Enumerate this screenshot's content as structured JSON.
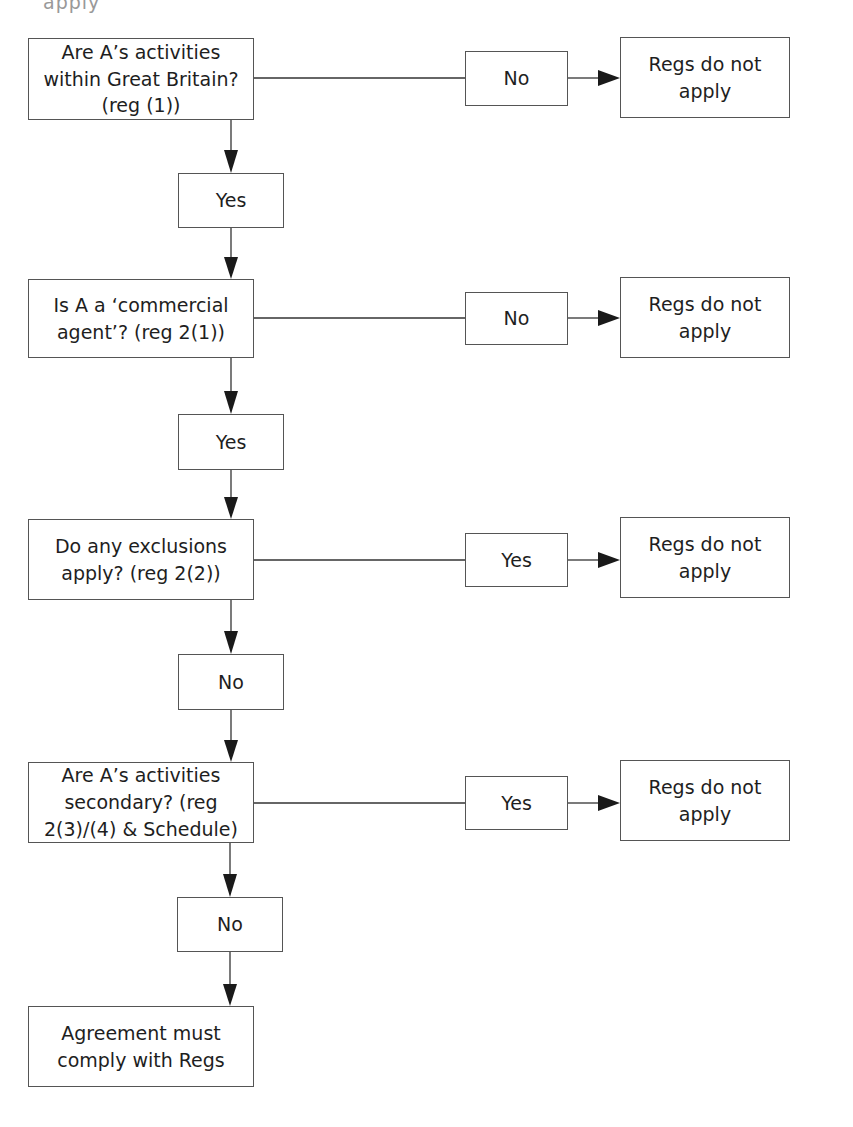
{
  "top_fragment": "apply",
  "rows": [
    {
      "question": "Are A’s activities within Great Britain? (reg (1))",
      "branch_label": "No",
      "outcome": "Regs do not apply",
      "continue_label": "Yes"
    },
    {
      "question": "Is A a ‘commercial agent’? (reg 2(1))",
      "branch_label": "No",
      "outcome": "Regs do not apply",
      "continue_label": "Yes"
    },
    {
      "question": "Do any exclusions apply? (reg 2(2))",
      "branch_label": "Yes",
      "outcome": "Regs do not apply",
      "continue_label": "No"
    },
    {
      "question": "Are A’s activities secondary? (reg 2(3)/(4) & Schedule)",
      "branch_label": "Yes",
      "outcome": "Regs do not apply",
      "continue_label": "No"
    }
  ],
  "final": "Agreement must comply with Regs",
  "colors": {
    "border": "#555555",
    "text": "#1e1e1e",
    "line": "#333333",
    "background": "#ffffff"
  }
}
